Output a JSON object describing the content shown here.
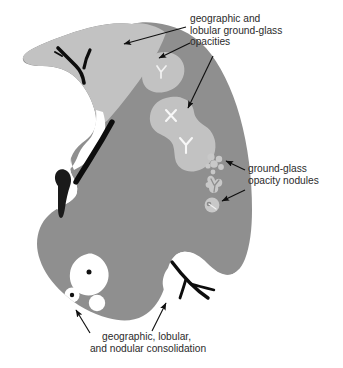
{
  "figure": {
    "background_color": "#ffffff"
  },
  "colors": {
    "lung_parenchyma": "#8f8f8f",
    "ground_glass": "#c2c2c2",
    "consolidation_hole": "#ffffff",
    "vessel": "#0d0d0d",
    "label_text": "#2b2b2b",
    "arrow": "#101010"
  },
  "labels": [
    {
      "id": "ground-glass-opacities",
      "lines": [
        "geographic and",
        "lobular ground-glass",
        "opacities"
      ],
      "x": 190,
      "y": 22,
      "arrow_count": 3
    },
    {
      "id": "ground-glass-opacity-nodules",
      "lines": [
        "ground-glass",
        "opacity nodules"
      ],
      "x": 248,
      "y": 172,
      "arrow_count": 2
    },
    {
      "id": "consolidation",
      "lines": [
        "geographic, lobular,",
        "and nodular consolidation"
      ],
      "x": 148,
      "y": 340,
      "arrow_count": 2
    }
  ],
  "regions": [
    {
      "id": "apex-ground-glass",
      "name": "geographic ground-glass opacity at apex",
      "type": "ground-glass"
    },
    {
      "id": "lung-body",
      "name": "lung parenchyma",
      "type": "parenchyma"
    },
    {
      "id": "upper-lobular-opacity",
      "name": "lobular ground-glass opacity",
      "type": "ground-glass"
    },
    {
      "id": "central-geographic-opacity",
      "name": "geographic ground-glass opacity",
      "type": "ground-glass"
    },
    {
      "id": "nodule-cluster",
      "name": "ground-glass opacity nodule cluster",
      "type": "nodule"
    },
    {
      "id": "nodule-branching",
      "name": "branching ground-glass nodule",
      "type": "nodule"
    },
    {
      "id": "nodule-solitary",
      "name": "solitary ground-glass nodule with vessel",
      "type": "nodule"
    },
    {
      "id": "consolidation-large",
      "name": "geographic consolidation",
      "type": "consolidation"
    },
    {
      "id": "consolidation-small-dotted",
      "name": "lobular consolidation with vessel",
      "type": "consolidation"
    },
    {
      "id": "consolidation-nodular",
      "name": "nodular consolidation",
      "type": "consolidation"
    },
    {
      "id": "vessel-apex",
      "name": "apical branching vessel",
      "type": "vessel"
    },
    {
      "id": "vessel-hilar-curve",
      "name": "curved hilar vessel",
      "type": "vessel"
    },
    {
      "id": "vessel-teardrop",
      "name": "teardrop hilar vessel",
      "type": "vessel"
    },
    {
      "id": "vessel-basal-branch",
      "name": "basal branching vessel",
      "type": "vessel"
    }
  ]
}
